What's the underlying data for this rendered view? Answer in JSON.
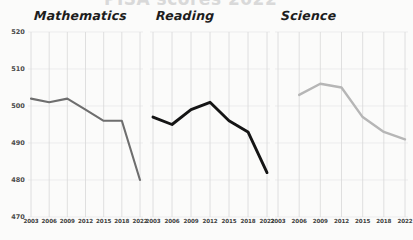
{
  "figure": {
    "clipped_supertitle": "PISA scores 2022",
    "background_color": "#fbfbfa"
  },
  "axis": {
    "y_ticks": [
      520,
      510,
      500,
      490,
      480,
      470
    ],
    "y_min": 470,
    "y_max": 520,
    "x_ticks": [
      "2003",
      "2006",
      "2009",
      "2012",
      "2015",
      "2018",
      "2022"
    ]
  },
  "chart_data": {
    "type": "line",
    "title": "PISA scores 2022",
    "xlabel": "",
    "ylabel": "",
    "ylim": [
      470,
      520
    ],
    "x": [
      2003,
      2006,
      2009,
      2012,
      2015,
      2018,
      2022
    ],
    "grid": true,
    "legend_position": "none",
    "panels": [
      {
        "title": "Mathematics",
        "color": "#6e6e6e",
        "line_width": 2.1,
        "x": [
          2003,
          2006,
          2009,
          2012,
          2015,
          2018,
          2022
        ],
        "values": [
          502,
          501,
          502,
          499,
          496,
          496,
          480
        ]
      },
      {
        "title": "Reading",
        "color": "#151515",
        "line_width": 2.9,
        "x": [
          2003,
          2006,
          2009,
          2012,
          2015,
          2018,
          2022
        ],
        "values": [
          497,
          495,
          499,
          501,
          496,
          493,
          482
        ]
      },
      {
        "title": "Science",
        "color": "#b6b6b6",
        "line_width": 2.4,
        "x": [
          2006,
          2009,
          2012,
          2015,
          2018,
          2022
        ],
        "values": [
          503,
          506,
          505,
          497,
          493,
          491
        ]
      }
    ]
  }
}
